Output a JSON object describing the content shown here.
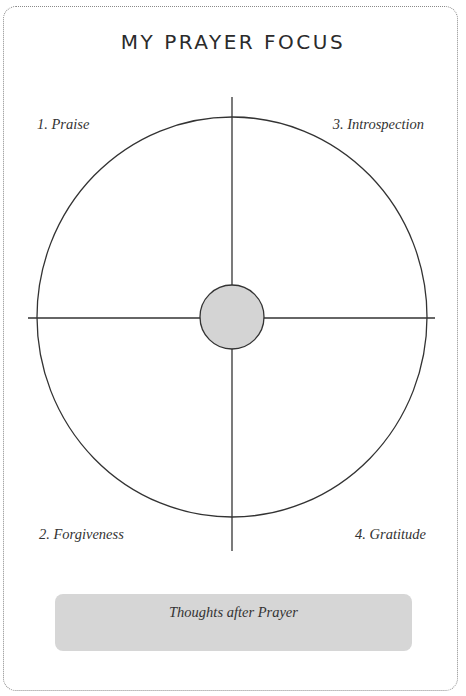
{
  "page": {
    "title": "MY PRAYER FOCUS"
  },
  "quadrants": [
    {
      "label": "1. Praise",
      "position": "top-left"
    },
    {
      "label": "2. Forgiveness",
      "position": "bottom-left"
    },
    {
      "label": "3. Introspection",
      "position": "top-right"
    },
    {
      "label": "4. Gratitude",
      "position": "bottom-right"
    }
  ],
  "thoughts_box": {
    "label": "Thoughts after Prayer"
  },
  "colors": {
    "line": "#333333",
    "center_fill": "#d4d4d4",
    "box_fill": "#d6d6d6",
    "frame_border": "#8a8a8a"
  }
}
